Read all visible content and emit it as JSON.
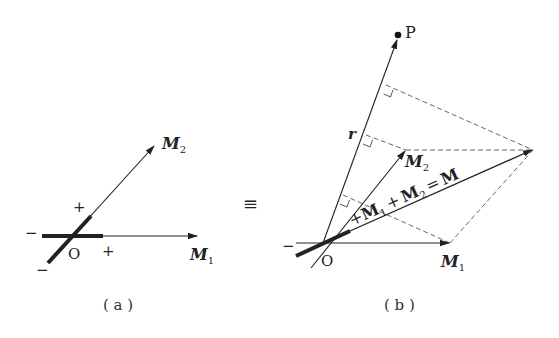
{
  "diagram": {
    "panel_a": {
      "caption": "( a )",
      "origin_label": "O",
      "vector1": {
        "label": "M",
        "subscript": "1"
      },
      "vector2": {
        "label": "M",
        "subscript": "2"
      },
      "signs": {
        "plus_upper": "+",
        "plus_right": "+",
        "minus_left": "−",
        "minus_lower": "−"
      }
    },
    "equivalence_symbol": "≡",
    "panel_b": {
      "caption": "( b )",
      "origin_label": "O",
      "point_label": "P",
      "position_vector_label": "r",
      "vector1": {
        "label": "M",
        "subscript": "1"
      },
      "vector2": {
        "label": "M",
        "subscript": "2"
      },
      "resultant": {
        "prefix": "+",
        "label_m1": "M",
        "sub1": "1",
        "plus": "+",
        "label_m2": "M",
        "sub2": "2",
        "equals": "=",
        "label_m": "M"
      },
      "signs": {
        "minus_left": "−"
      }
    },
    "colors": {
      "line": "#222222",
      "dashed": "#555555",
      "background": "#ffffff"
    }
  }
}
